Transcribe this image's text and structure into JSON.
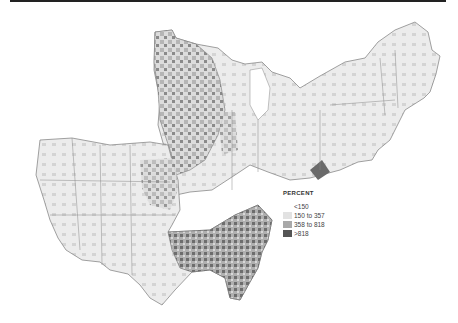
{
  "legend": {
    "title": "PERCENT",
    "items": [
      {
        "label": "<150",
        "color": "#ffffff"
      },
      {
        "label": "150 to 357",
        "color": "#e2e2e2"
      },
      {
        "label": "358 to 818",
        "color": "#a9a9a9"
      },
      {
        "label": ">818",
        "color": "#555555"
      }
    ]
  },
  "regions": [
    {
      "name": "West and South",
      "fill": "#ececec"
    },
    {
      "name": "Midwest and Northeast",
      "fill": "#e4e4e4"
    }
  ]
}
